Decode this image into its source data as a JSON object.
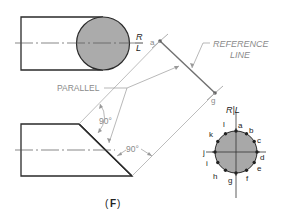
{
  "figure": {
    "caption": "(F)",
    "caption_letter": "F"
  },
  "labels": {
    "reference_line": [
      "REFERENCE",
      "LINE"
    ],
    "parallel": "PARALLEL",
    "angle_1": "90°",
    "angle_2": "90°",
    "rl_top_r": "R",
    "rl_top_l": "L",
    "rl_right": "R|L",
    "point_a": "a",
    "point_g": "g"
  },
  "circle_points": [
    "a",
    "b",
    "c",
    "d",
    "e",
    "f",
    "g",
    "h",
    "i",
    "j",
    "k",
    "l"
  ],
  "colors": {
    "outline": "#2a2a2a",
    "fill": "#a8a8a8",
    "construction": "#9a9a9a",
    "reference": "#707070"
  }
}
